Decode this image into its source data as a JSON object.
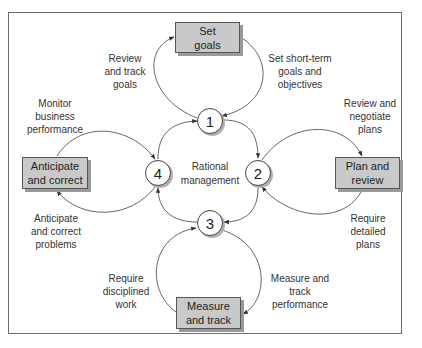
{
  "diagram": {
    "center_label": [
      "Rational",
      "management"
    ],
    "nodes": [
      {
        "id": "1",
        "label": "1"
      },
      {
        "id": "2",
        "label": "2"
      },
      {
        "id": "3",
        "label": "3"
      },
      {
        "id": "4",
        "label": "4"
      }
    ],
    "boxes": {
      "set_goals": [
        "Set",
        "goals"
      ],
      "plan_review": [
        "Plan and",
        "review"
      ],
      "measure_track": [
        "Measure",
        "and track"
      ],
      "anticipate_correct": [
        "Anticipate",
        "and correct"
      ]
    },
    "edge_labels": {
      "review_track_goals": [
        "Review",
        "and track",
        "goals"
      ],
      "set_short_term": [
        "Set short-term",
        "goals and",
        "objectives"
      ],
      "review_negotiate": [
        "Review and",
        "negotiate",
        "plans"
      ],
      "require_detailed": [
        "Require",
        "detailed",
        "plans"
      ],
      "measure_track_perf": [
        "Measure and",
        "track",
        "performance"
      ],
      "require_disciplined": [
        "Require",
        "disciplined",
        "work"
      ],
      "anticipate_problems": [
        "Anticipate",
        "and correct",
        "problems"
      ],
      "monitor_business": [
        "Monitor",
        "business",
        "performance"
      ]
    },
    "colors": {
      "box_fill": "#c9c9c9",
      "box_border": "#555555",
      "line": "#444444",
      "frame": "#6e6e6e"
    }
  }
}
